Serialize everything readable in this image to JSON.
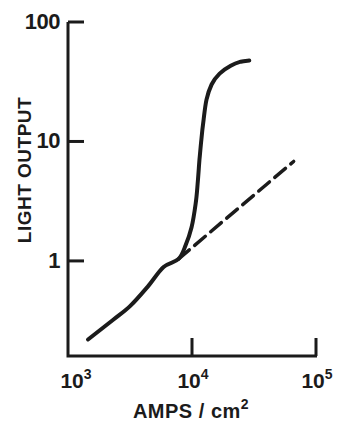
{
  "figure": {
    "background": "#ffffff",
    "ink": "#1b1b1b"
  },
  "chart_data": {
    "type": "line",
    "title": "",
    "xlabel": {
      "base": "AMPS / cm",
      "superscript": "2"
    },
    "ylabel": "LIGHT OUTPUT",
    "x_scale": "log",
    "y_scale": "log",
    "xlim": [
      1000,
      100000
    ],
    "ylim": [
      0.16,
      100
    ],
    "grid": false,
    "legend": null,
    "x_ticks": [
      {
        "value": 1000,
        "base": "10",
        "exp": "3",
        "tick_mark": false
      },
      {
        "value": 10000,
        "base": "10",
        "exp": "4",
        "tick_mark": true
      },
      {
        "value": 100000,
        "base": "10",
        "exp": "5",
        "tick_mark": true
      }
    ],
    "y_ticks": [
      {
        "value": 100,
        "label": "100"
      },
      {
        "value": 10,
        "label": "10"
      },
      {
        "value": 1,
        "label": "1"
      }
    ],
    "series": [
      {
        "name": "light-output-measured-curve",
        "style": "solid",
        "points": [
          [
            1450,
            0.22
          ],
          [
            2300,
            0.32
          ],
          [
            3180,
            0.42
          ],
          [
            4400,
            0.61
          ],
          [
            5900,
            0.89
          ],
          [
            7800,
            1.04
          ],
          [
            8900,
            1.36
          ],
          [
            9900,
            1.9
          ],
          [
            10700,
            3.0
          ],
          [
            11100,
            4.4
          ],
          [
            11500,
            7.1
          ],
          [
            11900,
            10.4
          ],
          [
            12400,
            15.2
          ],
          [
            13100,
            22.4
          ],
          [
            14400,
            30
          ],
          [
            16700,
            37
          ],
          [
            20500,
            43
          ],
          [
            24700,
            46.5
          ],
          [
            29000,
            47.5
          ]
        ]
      },
      {
        "name": "linear-extrapolation-dashed-line",
        "style": "dashed",
        "points": [
          [
            7800,
            1.04
          ],
          [
            66000,
            6.8
          ]
        ]
      }
    ]
  }
}
